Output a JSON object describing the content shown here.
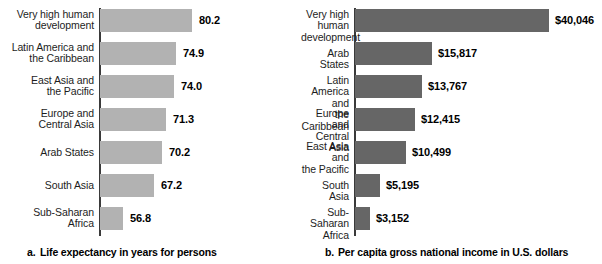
{
  "figure": {
    "background_color": "#ffffff",
    "text_color": "#1a1a1a"
  },
  "chart_data": [
    {
      "id": "a",
      "type": "bar",
      "orientation": "horizontal",
      "title": "Life expectancy in years for persons",
      "caption_tag": "a.",
      "caption_text": "Life expectancy in years for persons",
      "xlabel": "",
      "ylabel": "",
      "bar_color": "#b2b2b2",
      "grid": false,
      "legend": "none",
      "axis_baseline_value": 49,
      "axis_max_value": 84,
      "categories": [
        "Very high human development",
        "Latin America and the Caribbean",
        "East Asia and the Pacific",
        "Europe and Central Asia",
        "Arab States",
        "South Asia",
        "Sub-Saharan Africa"
      ],
      "category_lines": [
        [
          "Very high human",
          "development"
        ],
        [
          "Latin America and",
          "the Caribbean"
        ],
        [
          "East Asia and",
          "the Pacific"
        ],
        [
          "Europe and",
          "Central Asia"
        ],
        [
          "Arab States"
        ],
        [
          "South Asia"
        ],
        [
          "Sub-Saharan",
          "Africa"
        ]
      ],
      "values": [
        80.2,
        74.9,
        74.0,
        71.3,
        70.2,
        67.2,
        56.8
      ],
      "value_labels": [
        "80.2",
        "74.9",
        "74.0",
        "71.3",
        "70.2",
        "67.2",
        "56.8"
      ]
    },
    {
      "id": "b",
      "type": "bar",
      "orientation": "horizontal",
      "title": "Per capita gross national income in U.S. dollars",
      "caption_tag": "b.",
      "caption_text": "Per capita gross national income in U.S. dollars",
      "xlabel": "",
      "ylabel": "",
      "bar_color": "#666666",
      "grid": false,
      "legend": "none",
      "axis_baseline_value": 0,
      "axis_max_value": 40046,
      "categories": [
        "Very high human development",
        "Arab States",
        "Latin America and the Caribbean",
        "Europe and Central Asia",
        "East Asia and the Pacific",
        "South Asia",
        "Sub-Saharan Africa"
      ],
      "category_lines": [
        [
          "Very high human",
          "development"
        ],
        [
          "Arab States"
        ],
        [
          "Latin America and",
          "the Caribbean"
        ],
        [
          "Europe and",
          "Central Asia"
        ],
        [
          "East Asia and",
          "the Pacific"
        ],
        [
          "South Asia"
        ],
        [
          "Sub-Saharan",
          "Africa"
        ]
      ],
      "values": [
        40046,
        15817,
        13767,
        12415,
        10499,
        5195,
        3152
      ],
      "value_labels": [
        "$40,046",
        "$15,817",
        "$13,767",
        "$12,415",
        "$10,499",
        "$5,195",
        "$3,152"
      ]
    }
  ]
}
